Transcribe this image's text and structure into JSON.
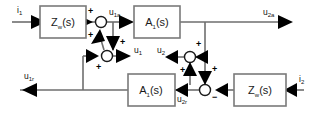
{
  "diagram": {
    "background_color": "#ffffff",
    "wire_color": "#6e6e6e",
    "block_border_color": "#7a7a7a",
    "arrow_color": "#000000",
    "text_color": "#111111",
    "blocks": [
      {
        "id": "zw-left",
        "base": "Z",
        "sub": "w",
        "tail": "(s)",
        "label": "Z_w(s)"
      },
      {
        "id": "a1-top",
        "base": "A",
        "sub": "1",
        "tail": "(s)",
        "label": "A_1(s)"
      },
      {
        "id": "a1-bottom",
        "base": "A",
        "sub": "1",
        "tail": "(s)",
        "label": "A_1(s)"
      },
      {
        "id": "zw-right",
        "base": "Z",
        "sub": "w",
        "tail": "(s)",
        "label": "Z_w(s)"
      }
    ],
    "signals": [
      {
        "id": "i1",
        "base": "i",
        "sub": "1",
        "label": "i_1"
      },
      {
        "id": "u1a",
        "base": "u",
        "sub": "1a",
        "label": "u_1a"
      },
      {
        "id": "u2a",
        "base": "u",
        "sub": "2a",
        "label": "u_2a"
      },
      {
        "id": "u1",
        "base": "u",
        "sub": "1",
        "label": "u_1"
      },
      {
        "id": "u2",
        "base": "u",
        "sub": "2",
        "label": "u_2"
      },
      {
        "id": "u1r",
        "base": "u",
        "sub": "1r",
        "label": "u_1r"
      },
      {
        "id": "u2r",
        "base": "u",
        "sub": "2r",
        "label": "u_2r"
      },
      {
        "id": "i2",
        "base": "i",
        "sub": "2",
        "label": "i_2"
      }
    ],
    "signs": {
      "sum_left_top": "+",
      "sum_left_bottom": "+",
      "sum_mid_top": "+",
      "sum_mid_bottom": "+",
      "sum_right_top": "+",
      "sum_right_bottom": "+",
      "sum_lower_top": "+",
      "sum_lower_right": "−"
    }
  }
}
